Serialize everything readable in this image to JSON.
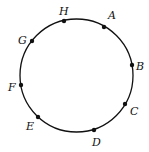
{
  "diagram": {
    "type": "circle-with-points",
    "circle": {
      "cx": 76.5,
      "cy": 75.5,
      "r": 56.5,
      "stroke": "#111111"
    },
    "points": [
      {
        "label": "A",
        "x": 104,
        "y": 27,
        "lx": 108,
        "ly": 19
      },
      {
        "label": "B",
        "x": 132,
        "y": 65,
        "lx": 136,
        "ly": 70
      },
      {
        "label": "C",
        "x": 125,
        "y": 104,
        "lx": 130,
        "ly": 115
      },
      {
        "label": "D",
        "x": 94,
        "y": 130,
        "lx": 92,
        "ly": 146
      },
      {
        "label": "E",
        "x": 38,
        "y": 117,
        "lx": 26,
        "ly": 130
      },
      {
        "label": "F",
        "x": 21,
        "y": 85,
        "lx": 8,
        "ly": 91
      },
      {
        "label": "G",
        "x": 32,
        "y": 41,
        "lx": 18,
        "ly": 44
      },
      {
        "label": "H",
        "x": 64,
        "y": 21,
        "lx": 59,
        "ly": 15
      }
    ]
  }
}
